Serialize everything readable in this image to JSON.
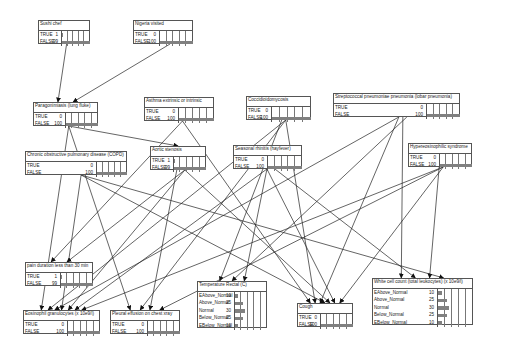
{
  "diagram": {
    "type": "bayesian-network",
    "bar_color": "#808080",
    "nodes": [
      {
        "id": "sushi",
        "title": "Sushi chef",
        "x": 38,
        "y": 20,
        "w": 52,
        "lblw": 22,
        "states": [
          {
            "label": "TRUE",
            "value": "1",
            "pct": 1
          },
          {
            "label": "FALSE",
            "value": "99",
            "pct": 99
          }
        ]
      },
      {
        "id": "nigeria",
        "title": "Nigeria visited",
        "x": 133,
        "y": 20,
        "w": 60,
        "lblw": 25,
        "states": [
          {
            "label": "TRUE",
            "value": "0",
            "pct": 0
          },
          {
            "label": "FALSE",
            "value": "100",
            "pct": 100
          }
        ]
      },
      {
        "id": "paragon",
        "title": "Paragonimiasis (lung fluke)",
        "x": 33,
        "y": 102,
        "w": 65,
        "lblw": 31,
        "states": [
          {
            "label": "TRUE",
            "value": "0",
            "pct": 0
          },
          {
            "label": "FALSE",
            "value": "100",
            "pct": 100
          }
        ]
      },
      {
        "id": "asthma",
        "title": "Asthma extrinsic or intrinsic",
        "x": 144,
        "y": 97,
        "w": 70,
        "lblw": 33,
        "states": [
          {
            "label": "TRUE",
            "value": "0",
            "pct": 0
          },
          {
            "label": "FALSE",
            "value": "100",
            "pct": 100
          }
        ]
      },
      {
        "id": "cocci",
        "title": "Coccidioidomycosis",
        "x": 246,
        "y": 96,
        "w": 65,
        "lblw": 24,
        "states": [
          {
            "label": "TRUE",
            "value": "0",
            "pct": 0
          },
          {
            "label": "FALSE",
            "value": "100",
            "pct": 100
          }
        ]
      },
      {
        "id": "strep",
        "title": "Streptococcal pneumoniae pneumonia (lobar pneumonia)",
        "x": 333,
        "y": 93,
        "w": 127,
        "lblw": 92,
        "states": [
          {
            "label": "TRUE",
            "value": "0",
            "pct": 0
          },
          {
            "label": "FALSE",
            "value": "100",
            "pct": 100
          }
        ]
      },
      {
        "id": "copd",
        "title": "Chronic obstructive pulmonary disease (COPD)",
        "x": 25,
        "y": 151,
        "w": 102,
        "lblw": 70,
        "states": [
          {
            "label": "TRUE",
            "value": "0",
            "pct": 0
          },
          {
            "label": "FALSE",
            "value": "100",
            "pct": 100
          }
        ]
      },
      {
        "id": "aortic",
        "title": "Aortic stenosis",
        "x": 150,
        "y": 146,
        "w": 56,
        "lblw": 22,
        "states": [
          {
            "label": "TRUE",
            "value": "1",
            "pct": 1
          },
          {
            "label": "FALSE",
            "value": "99",
            "pct": 99
          }
        ]
      },
      {
        "id": "rhinitis",
        "title": "Seasonal rhinitis (hayfever)",
        "x": 233,
        "y": 145,
        "w": 69,
        "lblw": 33,
        "states": [
          {
            "label": "TRUE",
            "value": "0",
            "pct": 0
          },
          {
            "label": "FALSE",
            "value": "100",
            "pct": 100
          }
        ]
      },
      {
        "id": "hyper",
        "title": "Hypereosinophilic syndrome",
        "x": 408,
        "y": 143,
        "w": 64,
        "lblw": 30,
        "states": [
          {
            "label": "TRUE",
            "value": "0",
            "pct": 0
          },
          {
            "label": "FALSE",
            "value": "100",
            "pct": 100
          }
        ]
      },
      {
        "id": "pain",
        "title": "pain duration less than 30 min",
        "x": 25,
        "y": 262,
        "w": 68,
        "lblw": 34,
        "states": [
          {
            "label": "TRUE",
            "value": "1",
            "pct": 1
          },
          {
            "label": "FALSE",
            "value": "99",
            "pct": 99
          }
        ]
      },
      {
        "id": "eosin",
        "title": "Eosinophil granulocytes (x 10e9/l)",
        "x": 23,
        "y": 310,
        "w": 77,
        "lblw": 43,
        "states": [
          {
            "label": "TRUE",
            "value": "0",
            "pct": 0
          },
          {
            "label": "FALSE",
            "value": "100",
            "pct": 100
          }
        ]
      },
      {
        "id": "pleural",
        "title": "Pleural effusion on chest xray",
        "x": 110,
        "y": 310,
        "w": 70,
        "lblw": 36,
        "states": [
          {
            "label": "TRUE",
            "value": "0",
            "pct": 0
          },
          {
            "label": "FALSE",
            "value": "100",
            "pct": 100
          }
        ]
      },
      {
        "id": "temp",
        "title": "Temperature Rectal (C)",
        "x": 197,
        "y": 281,
        "w": 70,
        "lblw": 36,
        "states": [
          {
            "label": "EAbove_Normal",
            "value": "10",
            "pct": 10
          },
          {
            "label": "Above_Normal",
            "value": "25",
            "pct": 25
          },
          {
            "label": "Normal",
            "value": "30",
            "pct": 30
          },
          {
            "label": "Below_Normal",
            "value": "25",
            "pct": 25
          },
          {
            "label": "EBelow_Normal",
            "value": "10",
            "pct": 10
          }
        ]
      },
      {
        "id": "cough",
        "title": "Cough",
        "x": 297,
        "y": 303,
        "w": 56,
        "lblw": 22,
        "states": [
          {
            "label": "TRUE",
            "value": "0",
            "pct": 0
          },
          {
            "label": "FALSE",
            "value": "100",
            "pct": 100
          }
        ]
      },
      {
        "id": "wbc",
        "title": "White cell count (total leukocytes) (x 10e9/l)",
        "x": 372,
        "y": 278,
        "w": 101,
        "lblw": 64,
        "states": [
          {
            "label": "EAbove_Normal",
            "value": "10",
            "pct": 10
          },
          {
            "label": "Above_Normal",
            "value": "25",
            "pct": 25
          },
          {
            "label": "Normal",
            "value": "30",
            "pct": 30
          },
          {
            "label": "Below_Normal",
            "value": "25",
            "pct": 25
          },
          {
            "label": "EBelow_Normal",
            "value": "10",
            "pct": 10
          }
        ]
      }
    ],
    "edges": [
      [
        "sushi",
        "paragon"
      ],
      [
        "nigeria",
        "paragon"
      ],
      [
        "paragon",
        "eosin"
      ],
      [
        "paragon",
        "pleural"
      ],
      [
        "paragon",
        "aortic"
      ],
      [
        "asthma",
        "pain"
      ],
      [
        "asthma",
        "cough"
      ],
      [
        "cocci",
        "eosin"
      ],
      [
        "cocci",
        "pleural"
      ],
      [
        "cocci",
        "temp"
      ],
      [
        "cocci",
        "cough"
      ],
      [
        "strep",
        "eosin"
      ],
      [
        "strep",
        "temp"
      ],
      [
        "strep",
        "cough"
      ],
      [
        "strep",
        "wbc"
      ],
      [
        "copd",
        "eosin"
      ],
      [
        "copd",
        "cough"
      ],
      [
        "aortic",
        "pain"
      ],
      [
        "aortic",
        "eosin"
      ],
      [
        "aortic",
        "pleural"
      ],
      [
        "aortic",
        "cough"
      ],
      [
        "rhinitis",
        "eosin"
      ],
      [
        "rhinitis",
        "temp"
      ],
      [
        "rhinitis",
        "cough"
      ],
      [
        "rhinitis",
        "wbc"
      ],
      [
        "hyper",
        "eosin"
      ],
      [
        "hyper",
        "pleural"
      ],
      [
        "hyper",
        "cough"
      ],
      [
        "hyper",
        "wbc"
      ],
      [
        "copd",
        "wbc"
      ]
    ]
  }
}
